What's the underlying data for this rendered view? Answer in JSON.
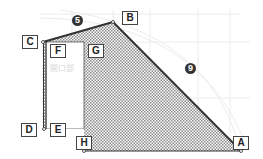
{
  "diagram": {
    "type": "geometry-figure",
    "points": {
      "A": {
        "label": "A",
        "x": 241,
        "y": 151
      },
      "B": {
        "label": "B",
        "x": 113,
        "y": 22
      },
      "C": {
        "label": "C",
        "x": 43,
        "y": 42
      },
      "D": {
        "label": "D",
        "x": 43,
        "y": 129
      },
      "E": {
        "label": "E"
      },
      "F": {
        "label": "F"
      },
      "G": {
        "label": "G"
      },
      "H": {
        "label": "H",
        "x": 84,
        "y": 129
      }
    },
    "edge_markers": [
      {
        "id": "edge-cb",
        "label": "5"
      },
      {
        "id": "edge-ba",
        "label": "9"
      }
    ],
    "opening_label": "開口部",
    "colors": {
      "edge": "#333333",
      "hatch": "#9a9a9a",
      "grid": "#e6e6e6",
      "label_border": "#444444"
    }
  }
}
